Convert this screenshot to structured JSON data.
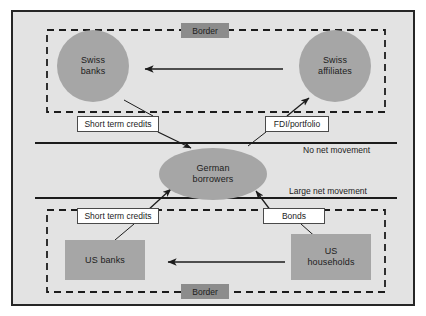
{
  "diagram": {
    "colors": {
      "canvas_background": "#e3e3e3",
      "frame_border": "#262626",
      "node_fill": "#a6a6a6",
      "border_tag_fill": "#8c8c8c",
      "callout_fill": "#ffffff",
      "line": "#1c1c1c"
    },
    "border_tags": [
      {
        "label": "Border"
      },
      {
        "label": "Border"
      }
    ],
    "nodes": [
      {
        "id": "swiss-banks",
        "label": "Swiss\nbanks",
        "line1": "Swiss",
        "line2": "banks",
        "shape": "circle"
      },
      {
        "id": "swiss-affiliates",
        "label": "Swiss\naffiliates",
        "line1": "Swiss",
        "line2": "affiliates",
        "shape": "circle"
      },
      {
        "id": "german-borrowers",
        "label": "German\nborrowers",
        "line1": "German",
        "line2": "borrowers",
        "shape": "ellipse"
      },
      {
        "id": "us-banks",
        "label": "US banks",
        "line1": "US banks",
        "line2": "",
        "shape": "rect"
      },
      {
        "id": "us-households",
        "label": "US\nhouseholds",
        "line1": "US",
        "line2": "households",
        "shape": "rect"
      }
    ],
    "callouts": [
      {
        "id": "short-term-credits-top",
        "label": "Short term credits"
      },
      {
        "id": "fdi-portfolio",
        "label": "FDI/portfolio"
      },
      {
        "id": "short-term-credits-bottom",
        "label": "Short term credits"
      },
      {
        "id": "bonds",
        "label": "Bonds"
      }
    ],
    "annotations": [
      {
        "id": "no-net-movement",
        "label": "No net movement"
      },
      {
        "id": "large-net-movement",
        "label": "Large net movement"
      }
    ]
  }
}
